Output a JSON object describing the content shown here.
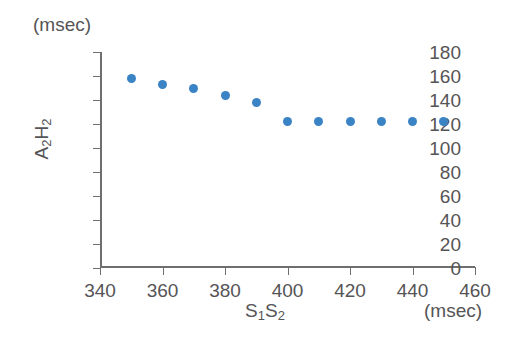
{
  "chart_data": {
    "type": "scatter",
    "title": "",
    "xlabel": "S₁S₂",
    "ylabel": "A₂H₂",
    "x_unit": "(msec)",
    "y_unit": "(msec)",
    "xlim": [
      340,
      460
    ],
    "ylim": [
      0,
      180
    ],
    "xticks": [
      340,
      360,
      380,
      400,
      420,
      440,
      460
    ],
    "yticks": [
      0,
      20,
      40,
      60,
      80,
      100,
      120,
      140,
      160,
      180
    ],
    "grid": false,
    "legend": null,
    "marker_color": "#3a83c4",
    "axis_color": "#6f6e70",
    "text_color": "#555456",
    "x": [
      350,
      360,
      370,
      380,
      390,
      400,
      410,
      420,
      430,
      440,
      450
    ],
    "values": [
      158,
      153,
      150,
      144,
      138,
      122,
      122,
      122,
      122,
      122,
      122
    ],
    "points": [
      {
        "x": 350,
        "y": 158
      },
      {
        "x": 360,
        "y": 153
      },
      {
        "x": 370,
        "y": 150
      },
      {
        "x": 380,
        "y": 144
      },
      {
        "x": 390,
        "y": 138
      },
      {
        "x": 400,
        "y": 122
      },
      {
        "x": 410,
        "y": 122
      },
      {
        "x": 420,
        "y": 122
      },
      {
        "x": 430,
        "y": 122
      },
      {
        "x": 440,
        "y": 122
      },
      {
        "x": 450,
        "y": 122
      }
    ]
  }
}
